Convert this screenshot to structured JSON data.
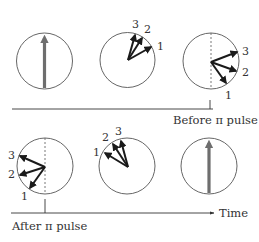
{
  "diagram": {
    "colors": {
      "circle": "#555555",
      "vector": "#1a1a1a",
      "big_arrow": "#6e6e6e",
      "axis": "#333333",
      "dashed": "#555555"
    },
    "labels": {
      "before": "Before π pulse",
      "after": "After π pulse",
      "time": "Time"
    },
    "spins": {
      "s1": "1",
      "s2": "2",
      "s3": "3"
    },
    "panels": [
      {
        "id": "initial",
        "description": "Aligned magnetization (single grey arrow up)"
      },
      {
        "id": "dephasing",
        "description": "Spins 1,2,3 fanning out clockwise"
      },
      {
        "id": "before-pulse",
        "description": "Spins 1,2,3 dephased to right of dashed axis"
      },
      {
        "id": "after-pulse",
        "description": "Spins 1,2,3 mirrored to left of dashed axis"
      },
      {
        "id": "refocusing",
        "description": "Spins 1,2,3 converging"
      },
      {
        "id": "echo",
        "description": "Refocused magnetization (single grey arrow up)"
      }
    ]
  }
}
